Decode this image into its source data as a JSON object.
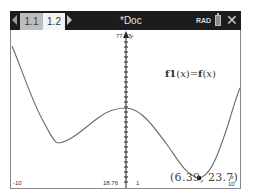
{
  "header": {
    "tabs": [
      {
        "label": "1.1",
        "active": false
      },
      {
        "label": "1.2",
        "active": true
      }
    ],
    "doc_title": "*Doc",
    "angle_mode": "RAD",
    "icons": [
      "nav-left-icon",
      "nav-right-icon",
      "battery-icon",
      "close-icon"
    ]
  },
  "graph": {
    "window": {
      "xmin_label": "-10",
      "xmax_label": "10",
      "ymax_label": "77.87",
      "ymin_label": "18.76",
      "x_tick_label": "1",
      "x_axis_name": "x",
      "y_axis_name": "y"
    },
    "function_label": {
      "name": "f1",
      "arg": "x",
      "rhs_name": "f",
      "rhs_arg": "x"
    },
    "point": {
      "x": "6.39",
      "y": "23.7",
      "text": "(6.39, 23.7)"
    },
    "colors": {
      "curve": "#6b6b6b",
      "axis": "#222222",
      "point": "#111111"
    }
  }
}
